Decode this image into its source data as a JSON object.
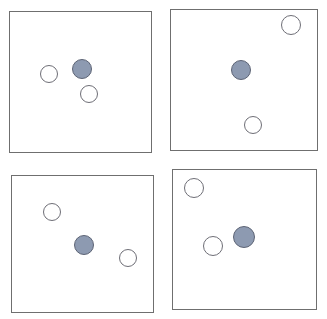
{
  "figure": {
    "name": "four-panel-circle-array",
    "background_color": "#ffffff",
    "width": 327,
    "height": 319,
    "panel_border_color": "#6f6f6f",
    "open_circle_fill": "#ffffff",
    "open_circle_stroke": "#6e6e76",
    "filled_circle_fill": "#8d9ab1",
    "filled_circle_stroke": "#5d6475"
  },
  "panels": [
    {
      "id": "panel-top-left",
      "label": "top-left",
      "x": 9,
      "y": 11,
      "width": 143,
      "height": 142,
      "circles": [
        {
          "id": "tl-open-1",
          "type": "open",
          "cx": 49,
          "cy": 74,
          "r": 9
        },
        {
          "id": "tl-filled-1",
          "type": "filled",
          "cx": 82,
          "cy": 69,
          "r": 10
        },
        {
          "id": "tl-open-2",
          "type": "open",
          "cx": 89,
          "cy": 94,
          "r": 9
        }
      ]
    },
    {
      "id": "panel-top-right",
      "label": "top-right",
      "x": 170,
      "y": 9,
      "width": 148,
      "height": 142,
      "circles": [
        {
          "id": "tr-open-1",
          "type": "open",
          "cx": 291,
          "cy": 25,
          "r": 10
        },
        {
          "id": "tr-filled-1",
          "type": "filled",
          "cx": 241,
          "cy": 70,
          "r": 10
        },
        {
          "id": "tr-open-2",
          "type": "open",
          "cx": 253,
          "cy": 125,
          "r": 9
        }
      ]
    },
    {
      "id": "panel-bottom-left",
      "label": "bottom-left",
      "x": 11,
      "y": 175,
      "width": 143,
      "height": 138,
      "circles": [
        {
          "id": "bl-open-1",
          "type": "open",
          "cx": 52,
          "cy": 212,
          "r": 9
        },
        {
          "id": "bl-filled-1",
          "type": "filled",
          "cx": 84,
          "cy": 245,
          "r": 10
        },
        {
          "id": "bl-open-2",
          "type": "open",
          "cx": 128,
          "cy": 258,
          "r": 9
        }
      ]
    },
    {
      "id": "panel-bottom-right",
      "label": "bottom-right",
      "x": 172,
      "y": 169,
      "width": 145,
      "height": 141,
      "circles": [
        {
          "id": "br-open-1",
          "type": "open",
          "cx": 194,
          "cy": 188,
          "r": 10
        },
        {
          "id": "br-open-2",
          "type": "open",
          "cx": 213,
          "cy": 246,
          "r": 10
        },
        {
          "id": "br-filled-1",
          "type": "filled",
          "cx": 244,
          "cy": 237,
          "r": 11
        }
      ]
    }
  ]
}
